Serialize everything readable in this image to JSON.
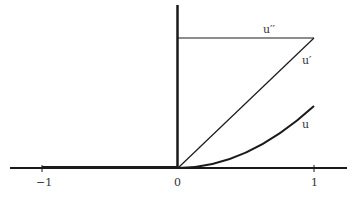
{
  "diagram": {
    "type": "function-graph",
    "axes": {
      "x_ticks": [
        {
          "value": -1,
          "label": "−1"
        },
        {
          "value": 0,
          "label": "0"
        },
        {
          "value": 1,
          "label": "1"
        }
      ]
    },
    "curves": [
      {
        "id": "u2",
        "label": "u′′",
        "description": "constant (step) second derivative for x>0"
      },
      {
        "id": "u1",
        "label": "u′",
        "description": "linear ramp first derivative for x>0"
      },
      {
        "id": "u0",
        "label": "u",
        "description": "quadratic function for x>0"
      }
    ],
    "colors": {
      "ink": "#1a1a1a",
      "background": "#ffffff"
    }
  }
}
